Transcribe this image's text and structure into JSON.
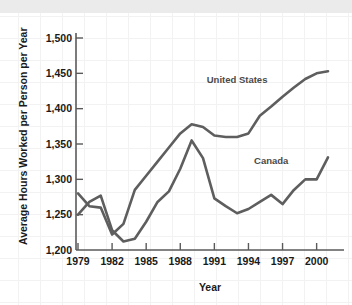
{
  "chart_data": {
    "type": "line",
    "title": "",
    "xlabel": "Year",
    "ylabel": "Average Hours Worked per Person per Year",
    "xlim": [
      1979,
      2001
    ],
    "ylim": [
      1200,
      1500
    ],
    "grid": false,
    "legend_position": "inline-annotation",
    "xticks": [
      "1979",
      "1982",
      "1985",
      "1988",
      "1991",
      "1994",
      "1997",
      "2000"
    ],
    "xtick_values": [
      1979,
      1982,
      1985,
      1988,
      1991,
      1994,
      1997,
      2000
    ],
    "yticks": [
      "1,200",
      "1,250",
      "1,300",
      "1,350",
      "1,400",
      "1,450",
      "1,500"
    ],
    "ytick_values": [
      1200,
      1250,
      1300,
      1350,
      1400,
      1450,
      1500
    ],
    "x": [
      1979,
      1980,
      1981,
      1982,
      1983,
      1984,
      1985,
      1986,
      1987,
      1988,
      1989,
      1990,
      1991,
      1992,
      1993,
      1994,
      1995,
      1996,
      1997,
      1998,
      1999,
      2000,
      2001
    ],
    "series": [
      {
        "name": "United States",
        "color": "#5e5e5e",
        "values": [
          1280,
          1262,
          1260,
          1222,
          1237,
          1285,
          1305,
          1325,
          1345,
          1365,
          1378,
          1374,
          1362,
          1360,
          1360,
          1365,
          1390,
          1403,
          1417,
          1430,
          1442,
          1450,
          1453
        ],
        "label_x": 1993,
        "label_y": 1437
      },
      {
        "name": "Canada",
        "color": "#5e5e5e",
        "values": [
          1250,
          1268,
          1277,
          1228,
          1212,
          1216,
          1240,
          1268,
          1283,
          1315,
          1355,
          1330,
          1273,
          1262,
          1252,
          1258,
          1268,
          1278,
          1265,
          1285,
          1300,
          1300,
          1331
        ],
        "label_x": 1996,
        "label_y": 1322
      }
    ]
  },
  "axes": {
    "x_title": "Year",
    "y_title": "Average Hours Worked per Person per Year"
  },
  "colors": {
    "line": "#5e5e5e",
    "axis": "#5a5a5a",
    "text": "#1a1a1a",
    "label_text": "#4a4a4a",
    "background": "#ffffff",
    "grid": "#f2f2f2",
    "top_band": "#ebebeb"
  }
}
